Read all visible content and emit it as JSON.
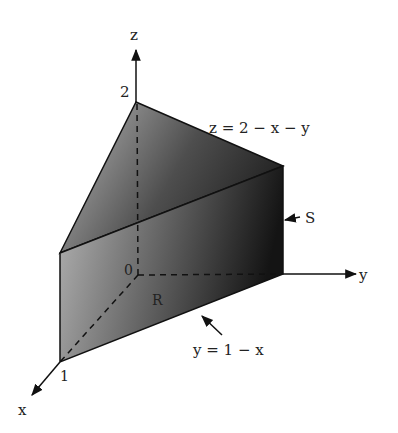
{
  "figure": {
    "axes": {
      "x_label": "x",
      "y_label": "y",
      "z_label": "z"
    },
    "ticks": {
      "origin": "0",
      "x_tick": "1",
      "z_tick": "2"
    },
    "annotations": {
      "top_surface": "z = 2 − x − y",
      "solid_label": "S",
      "region_label": "R",
      "boundary_curve": "y = 1 − x"
    },
    "colors": {
      "dark_face": "#1e1e1e",
      "mid_face": "#6a6a6a",
      "light_face": "#b8b8b8",
      "line": "#111111"
    }
  }
}
